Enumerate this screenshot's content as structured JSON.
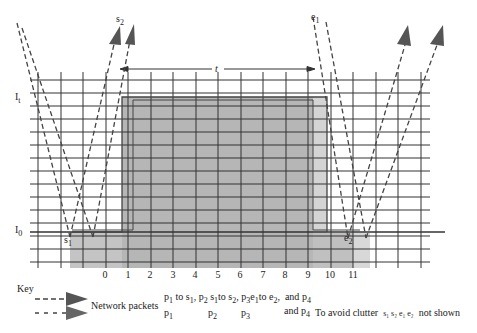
{
  "diagram": {
    "axis_labels": {
      "I_t": "I",
      "I_t_sub": "t",
      "I_0": "I",
      "I_0_sub": "0",
      "t": "t"
    },
    "ticks": [
      "0",
      "1",
      "2",
      "3",
      "4",
      "5",
      "6",
      "7",
      "8",
      "9",
      "10",
      "11"
    ],
    "point_labels": {
      "s1": "s",
      "s1_sub": "1",
      "s2": "s",
      "s2_sub": "2",
      "e1": "e",
      "e1_sub": "1",
      "e2": "e",
      "e2_sub": "2"
    },
    "colors": {
      "grid": "#333333",
      "shade_dark": "#b4b4b4",
      "shade_light": "#d6d6d6",
      "arrow": "#444444"
    }
  },
  "key": {
    "title": "Key",
    "network_packets_label": "Network packets",
    "row1": {
      "p1": "p",
      "p1_sub": "1",
      "p1_text": "to s",
      "p1_text_sub": "1",
      "p2": "p",
      "p2_sub": "2",
      "p2_text": "s",
      "p2_text_sub": "1",
      "p2_text2": "to s",
      "p2_text2_sub": "2",
      "p3": "p",
      "p3_sub": "3",
      "p3_text": "e",
      "p3_text_sub": "1",
      "p3_text2": "to e",
      "p3_text2_sub": "2",
      "and": "and",
      "p4": "p",
      "p4_sub": "4"
    },
    "row2": {
      "p1": "p",
      "p1_sub": "1",
      "p2": "p",
      "p2_sub": "2",
      "p3": "p",
      "p3_sub": "3",
      "and": "and",
      "p4": "p",
      "p4_sub": "4",
      "note": "To avoid clutter",
      "note_items": "s₁ s₂ e₁ e₂",
      "note_end": "not shown"
    }
  }
}
